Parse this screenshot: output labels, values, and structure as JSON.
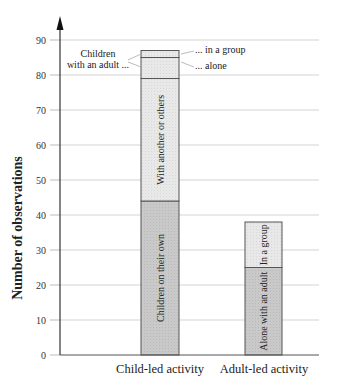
{
  "chart_data": {
    "type": "bar",
    "stacked": true,
    "title": "",
    "xlabel": "",
    "ylabel": "Number of observations",
    "ylim": [
      0,
      90
    ],
    "yticks": [
      0,
      10,
      20,
      30,
      40,
      50,
      60,
      70,
      80,
      90
    ],
    "grid": true,
    "categories": [
      "Child-led activity",
      "Adult-led activity"
    ],
    "bars": [
      {
        "category": "Child-led activity",
        "segments": [
          {
            "label": "Children on their own",
            "value": 44,
            "color": "#c8c8c8"
          },
          {
            "label": "With another or others",
            "value": 35,
            "color": "#e6e6e6"
          },
          {
            "label": "Children with an adult ... alone",
            "value": 6,
            "color": "#e6e6e6"
          },
          {
            "label": "Children with an adult ... in a group",
            "value": 2,
            "color": "#dcdcdc"
          }
        ],
        "total": 87
      },
      {
        "category": "Adult-led activity",
        "segments": [
          {
            "label": "Alone with an adult",
            "value": 25,
            "color": "#c8c8c8"
          },
          {
            "label": "In a group",
            "value": 13,
            "color": "#e6e6e6"
          }
        ],
        "total": 38
      }
    ],
    "annotations": {
      "left": "Children with an adult ...",
      "left_line1": "Children",
      "left_line2": "with an adult ...",
      "right_top": "... in a group",
      "right_bottom": "... alone"
    }
  }
}
